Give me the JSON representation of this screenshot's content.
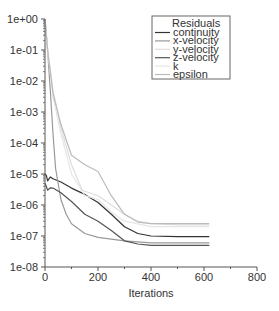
{
  "chart_data": {
    "type": "line",
    "title": "",
    "xlabel": "Iterations",
    "ylabel": "",
    "xlim": [
      0,
      800
    ],
    "ylim": [
      1e-08,
      1
    ],
    "yscale": "log",
    "grid": false,
    "legend_position": "upper right",
    "legend_title": "Residuals",
    "x_ticks": [
      0,
      200,
      400,
      600,
      800
    ],
    "x_tick_labels": [
      "0",
      "200",
      "400",
      "600",
      "800"
    ],
    "y_ticks": [
      1,
      0.1,
      0.01,
      0.001,
      0.0001,
      1e-05,
      1e-06,
      1e-07,
      1e-08
    ],
    "y_tick_labels": [
      "1e+00",
      "1e-01",
      "1e-02",
      "1e-03",
      "1e-04",
      "1e-05",
      "1e-06",
      "1e-07",
      "1e-08"
    ],
    "series": [
      {
        "name": "continuity",
        "color": "#333333",
        "x": [
          0,
          5,
          10,
          20,
          30,
          60,
          100,
          150,
          200,
          250,
          300,
          350,
          400,
          500,
          620
        ],
        "values": [
          1e-05,
          9e-06,
          6e-06,
          8e-06,
          7e-06,
          5.5e-06,
          3.5e-06,
          2.2e-06,
          1.2e-06,
          5e-07,
          2e-07,
          1.2e-07,
          1e-07,
          9.5e-08,
          9.5e-08
        ]
      },
      {
        "name": "x-velocity",
        "color": "#999999",
        "x": [
          0,
          10,
          20,
          30,
          40,
          60,
          80,
          100,
          150,
          200,
          300,
          400,
          500,
          620
        ],
        "values": [
          1,
          0.1,
          0.005,
          0.0002,
          1.5e-05,
          1.5e-06,
          5e-07,
          2.5e-07,
          1.2e-07,
          9e-08,
          7e-08,
          6e-08,
          6e-08,
          6e-08
        ]
      },
      {
        "name": "y-velocity",
        "color": "#dddddd",
        "x": [
          0,
          10,
          30,
          60,
          100,
          140,
          200,
          250,
          300,
          350,
          400,
          500,
          620
        ],
        "values": [
          1,
          0.1,
          0.005,
          0.0003,
          2e-05,
          3e-06,
          2e-06,
          1e-06,
          5e-07,
          3e-07,
          2.5e-07,
          2.3e-07,
          2.3e-07
        ]
      },
      {
        "name": "z-velocity",
        "color": "#555555",
        "x": [
          0,
          5,
          10,
          20,
          30,
          60,
          100,
          150,
          200,
          250,
          300,
          350,
          400,
          500,
          620
        ],
        "values": [
          5e-06,
          4e-06,
          3e-06,
          3.6e-06,
          3.5e-06,
          2.5e-06,
          1.3e-06,
          5e-07,
          3e-07,
          1.5e-07,
          7e-08,
          5.5e-08,
          5e-08,
          5e-08,
          5e-08
        ]
      },
      {
        "name": "k",
        "color": "#e6e6e6",
        "x": [
          0,
          10,
          30,
          60,
          100,
          150,
          200,
          250,
          300,
          400,
          500,
          620
        ],
        "values": [
          1,
          0.1,
          0.003,
          0.0002,
          1e-05,
          2e-06,
          1.5e-06,
          6e-07,
          3e-07,
          2e-07,
          2e-07,
          2e-07
        ]
      },
      {
        "name": "epsilon",
        "color": "#bbbbbb",
        "x": [
          0,
          10,
          30,
          60,
          100,
          150,
          200,
          250,
          300,
          350,
          400,
          500,
          620
        ],
        "values": [
          1,
          0.1,
          0.004,
          0.0004,
          4e-05,
          2e-05,
          1.2e-05,
          2e-06,
          5e-07,
          2.8e-07,
          2.5e-07,
          2.5e-07,
          2.5e-07
        ]
      }
    ]
  }
}
